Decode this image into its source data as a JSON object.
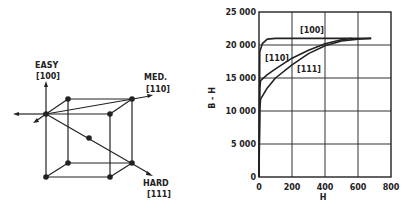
{
  "diagram": {
    "easy_label": "EASY",
    "easy_dir": "[100]",
    "med_label": "MED.",
    "med_dir": "[110]",
    "hard_label": "HARD",
    "hard_dir": "[111]"
  },
  "chart_data": {
    "type": "line",
    "title": "",
    "xlabel": "H",
    "ylabel": "B - H",
    "xlim": [
      0,
      800
    ],
    "ylim": [
      0,
      25000
    ],
    "grid": true,
    "x_ticks": [
      "0",
      "200",
      "400",
      "600",
      "800"
    ],
    "y_ticks": [
      "0",
      "5 000",
      "10 000",
      "15 000",
      "20 000",
      "25 000"
    ],
    "series": [
      {
        "name": "[100]",
        "x": [
          0,
          5,
          20,
          50,
          100,
          200,
          400,
          680
        ],
        "y": [
          0,
          19000,
          20200,
          20900,
          21000,
          21000,
          21000,
          21000
        ]
      },
      {
        "name": "[110]",
        "x": [
          0,
          5,
          10,
          50,
          100,
          200,
          300,
          400,
          500,
          560
        ],
        "y": [
          0,
          13500,
          14600,
          15500,
          16400,
          18000,
          19200,
          20200,
          20800,
          21000
        ]
      },
      {
        "name": "[111]",
        "x": [
          0,
          5,
          10,
          50,
          100,
          200,
          300,
          400,
          500,
          600,
          680
        ],
        "y": [
          0,
          10500,
          11800,
          13500,
          15000,
          17000,
          18700,
          19900,
          20600,
          20900,
          21000
        ]
      }
    ]
  }
}
